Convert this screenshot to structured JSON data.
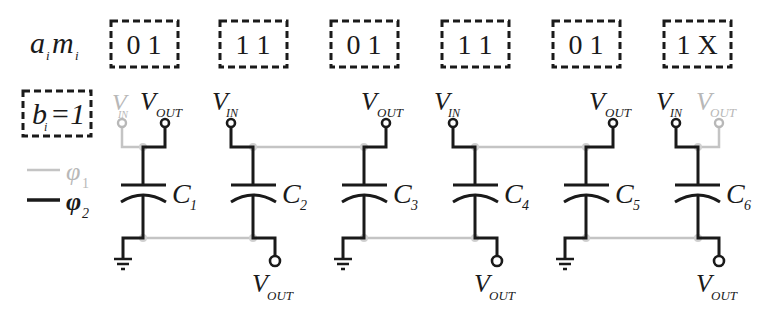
{
  "labels": {
    "row_label_a": "a",
    "row_label_a_sub": "i",
    "row_label_m": "m",
    "row_label_m_sub": "i",
    "b_label": "b",
    "b_sub": "i",
    "b_value": "=1",
    "phi1": "φ",
    "phi1_sub": "1",
    "phi2": "φ",
    "phi2_sub": "2",
    "v": "V",
    "in": "IN",
    "out": "OUT"
  },
  "colors": {
    "phase1": "#c4c4c4",
    "phase2": "#1a1a1a"
  },
  "cells": [
    {
      "bits": "0 1",
      "cap": "C",
      "cap_sub": "1"
    },
    {
      "bits": "1 1",
      "cap": "C",
      "cap_sub": "2"
    },
    {
      "bits": "0 1",
      "cap": "C",
      "cap_sub": "3"
    },
    {
      "bits": "1 1",
      "cap": "C",
      "cap_sub": "4"
    },
    {
      "bits": "0 1",
      "cap": "C",
      "cap_sub": "5"
    },
    {
      "bits": "1 X",
      "cap": "C",
      "cap_sub": "6"
    }
  ]
}
